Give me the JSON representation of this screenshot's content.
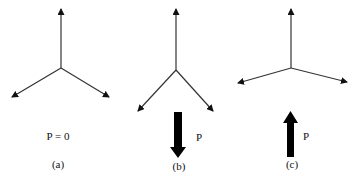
{
  "diagram": {
    "panels": [
      {
        "id": "a",
        "caption": "(a)",
        "load_label": "P = 0",
        "load_direction": "none"
      },
      {
        "id": "b",
        "caption": "(b)",
        "load_label": "P",
        "load_direction": "down"
      },
      {
        "id": "c",
        "caption": "(c)",
        "load_label": "P",
        "load_direction": "up"
      }
    ],
    "colors": {
      "line": "#333333",
      "arrow": "#000000",
      "background": "#ffffff"
    }
  }
}
